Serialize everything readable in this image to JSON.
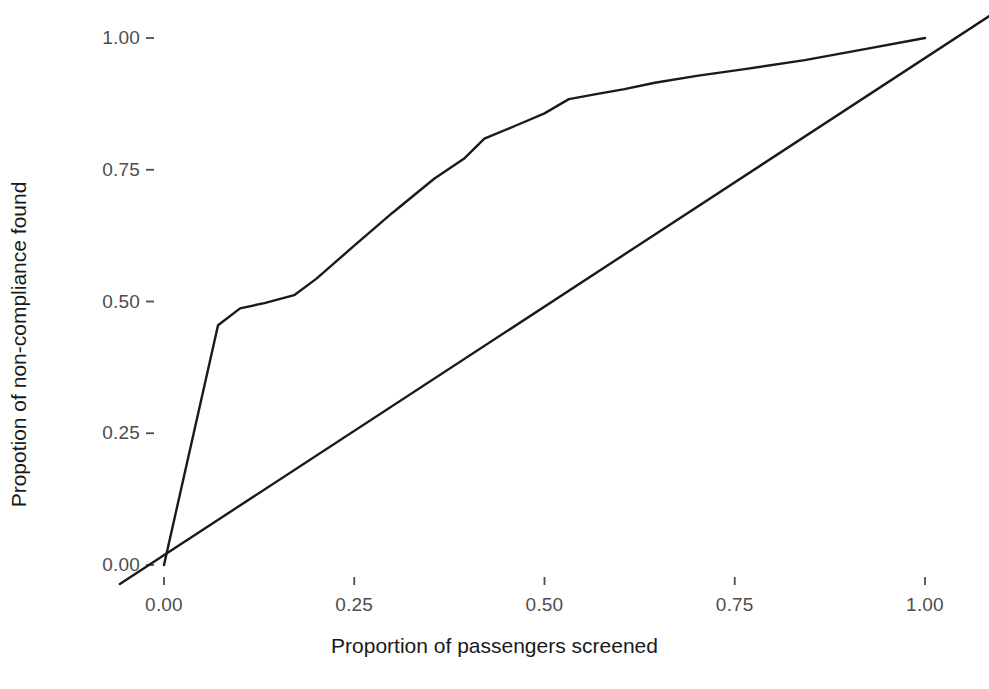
{
  "chart_data": {
    "type": "line",
    "title": "",
    "subtitle": "",
    "xlabel": "Proportion of passengers screened",
    "ylabel": "Propotion of non-compliance found",
    "xlim": [
      -0.06,
      1.09
    ],
    "ylim": [
      -0.04,
      1.045
    ],
    "xticks": [
      0.0,
      0.25,
      0.5,
      0.75,
      1.0
    ],
    "xtick_labels": [
      "0.00",
      "0.25",
      "0.50",
      "0.75",
      "1.00"
    ],
    "yticks": [
      0.0,
      0.25,
      0.5,
      0.75,
      1.0
    ],
    "ytick_labels": [
      "0.00",
      "0.25",
      "0.50",
      "0.75",
      "1.00"
    ],
    "grid": false,
    "legend": "none",
    "background": "#ffffff",
    "line_color": "#1a1a1a",
    "line_width": 2.4,
    "series": [
      {
        "name": "Cumulative non-compliance detection curve",
        "x": [
          0.0,
          0.071,
          0.1,
          0.132,
          0.171,
          0.2,
          0.25,
          0.3,
          0.355,
          0.395,
          0.421,
          0.461,
          0.5,
          0.532,
          0.566,
          0.605,
          0.645,
          0.7,
          0.763,
          0.842,
          0.921,
          1.0
        ],
        "y": [
          0.0,
          0.455,
          0.487,
          0.497,
          0.512,
          0.543,
          0.606,
          0.668,
          0.733,
          0.772,
          0.809,
          0.833,
          0.857,
          0.884,
          0.893,
          0.903,
          0.915,
          0.928,
          0.941,
          0.958,
          0.979,
          1.0
        ]
      },
      {
        "name": "Reference diagonal (random screening)",
        "x": [
          -0.058,
          1.086
        ],
        "y": [
          -0.036,
          1.043
        ]
      }
    ]
  },
  "axes": {
    "x_title": "Proportion of passengers screened",
    "y_title": "Propotion of non-compliance found",
    "x_tick_labels": [
      "0.00",
      "0.25",
      "0.50",
      "0.75",
      "1.00"
    ],
    "y_tick_labels": [
      "0.00",
      "0.25",
      "0.50",
      "0.75",
      "1.00"
    ]
  }
}
